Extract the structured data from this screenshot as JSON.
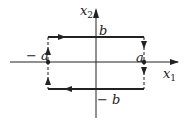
{
  "axes": {
    "x_label": "x",
    "x_sub": "1",
    "y_label": "x",
    "y_sub": "2"
  },
  "labels": {
    "b": "b",
    "neg_b": "− b",
    "a": "a",
    "neg_a": "− a"
  },
  "colors": {
    "ink": "#222222"
  }
}
